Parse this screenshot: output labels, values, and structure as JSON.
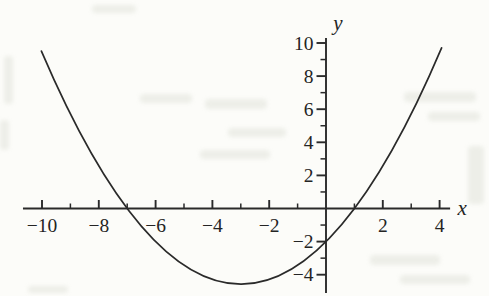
{
  "page": {
    "background": "#fcfcf9",
    "ink": "#2a2a2a"
  },
  "chart_data": {
    "type": "line",
    "title": "",
    "xlabel": "x",
    "ylabel": "y",
    "grid": false,
    "legend": null,
    "curve": {
      "equation_text": "y = (2/7)(x + 7)(x − 1)",
      "a": 0.2857142857,
      "roots": [
        -7,
        1
      ],
      "domain": [
        -10.02,
        4.07
      ]
    },
    "key_points": {
      "x_intercepts": [
        -7,
        1
      ],
      "y_intercept": -2,
      "vertex": [
        -3,
        -4.57
      ]
    },
    "points": [
      [
        -10,
        9.43
      ],
      [
        -9.5,
        7.5
      ],
      [
        -9,
        5.71
      ],
      [
        -8.5,
        4.07
      ],
      [
        -8,
        2.57
      ],
      [
        -7.5,
        1.21
      ],
      [
        -7,
        0
      ],
      [
        -6.5,
        -1.07
      ],
      [
        -6,
        -2
      ],
      [
        -5.5,
        -2.79
      ],
      [
        -5,
        -3.43
      ],
      [
        -4.5,
        -3.93
      ],
      [
        -4,
        -4.29
      ],
      [
        -3.5,
        -4.5
      ],
      [
        -3,
        -4.57
      ],
      [
        -2.5,
        -4.5
      ],
      [
        -2,
        -4.29
      ],
      [
        -1.5,
        -3.93
      ],
      [
        -1,
        -3.43
      ],
      [
        -0.5,
        -2.79
      ],
      [
        0,
        -2
      ],
      [
        0.5,
        -1.07
      ],
      [
        1,
        0
      ],
      [
        1.5,
        1.21
      ],
      [
        2,
        2.57
      ],
      [
        2.5,
        4.07
      ],
      [
        3,
        5.71
      ],
      [
        3.5,
        7.5
      ],
      [
        4,
        9.43
      ]
    ],
    "x_axis": {
      "label": "x",
      "line_range": [
        -10.67,
        4.37
      ],
      "major_ticks": [
        -10,
        -8,
        -6,
        -4,
        -2,
        2,
        4
      ],
      "minor_ticks": [
        -9,
        -7,
        -5,
        -3,
        -1,
        1,
        3
      ],
      "tick_labels": [
        {
          "v": -10,
          "t": "−10"
        },
        {
          "v": -8,
          "t": "−8"
        },
        {
          "v": -6,
          "t": "−6"
        },
        {
          "v": -4,
          "t": "−4"
        },
        {
          "v": -2,
          "t": "−2"
        },
        {
          "v": 2,
          "t": "2"
        },
        {
          "v": 4,
          "t": "4"
        }
      ]
    },
    "y_axis": {
      "label": "y",
      "line_range": [
        -5.1,
        10.3
      ],
      "major_ticks": [
        10,
        8,
        6,
        4,
        2,
        -2,
        -4
      ],
      "minor_ticks": [
        9,
        7,
        5,
        3,
        1,
        -1,
        -3
      ],
      "tick_labels": [
        {
          "v": 10,
          "t": "10"
        },
        {
          "v": 8,
          "t": "8"
        },
        {
          "v": 6,
          "t": "6"
        },
        {
          "v": 4,
          "t": "4"
        },
        {
          "v": 2,
          "t": "2"
        },
        {
          "v": -2,
          "t": "−2"
        },
        {
          "v": -4,
          "t": "−4"
        }
      ]
    }
  }
}
